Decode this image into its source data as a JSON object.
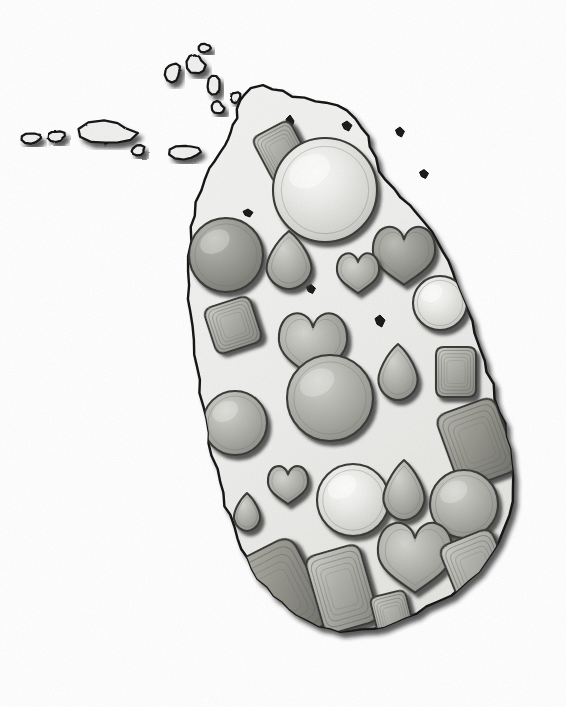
{
  "illustration": {
    "title": "Sri Lanka Gemstone Map",
    "subject": "Map of Sri Lanka filled with cut gemstones",
    "style": "hand-drawn pencil-shaded grayscale illustration",
    "background_color": "#ffffff",
    "landmass_fill": "#eeeeec",
    "landmass_outline_color": "#111111",
    "drop_shadow_color": "#2a2a2a",
    "gem_outline_color": "#3a3a3a",
    "caption": ""
  },
  "palette": {
    "gem_light_highlight": "#f2f2f0",
    "gem_light_mid": "#d9d9d6",
    "gem_mid_highlight": "#c6c6c2",
    "gem_mid_base": "#a2a29e",
    "gem_dark_base": "#8d8d89",
    "gem_edge": "#6d6d69",
    "island_fill": "#eeeeec",
    "island_stroke": "#111111",
    "sea": "#ffffff"
  },
  "landmass": {
    "name": "Sri Lanka",
    "outline_path": "M243,95 L238,108 L234,118 L230,124 L226,129 L222,133 L219,138 L216,144 L214,150 L211,157 L208,164 L205,172 L202,181 L199,190 L196,199 L194,208 L192,217 L190,226 L189,235 L188,244 L186,252 L185,261 L184,270 L183,279 L183,288 L183,297 L184,306 L185,315 L187,324 L189,333 L191,342 L193,351 L195,360 L197,369 L199,378 L202,387 L205,396 L208,405 L211,414 L214,423 L217,432 L220,441 L224,450 L228,459 L232,468 L236,477 L240,486 L244,495 L248,504 L252,513 L257,522 L262,531 L267,540 L272,549 L278,558 L284,566 L290,574 L297,581 L304,588 L311,594 L318,600 L325,605 L332,610 L339,614 L346,618 L353,621 L360,624 L367,626 L374,627 L381,628 L388,628 L395,627 L402,625 L409,622 L416,619 L423,615 L430,610 L437,604 L443,597 L449,590 L455,582 L460,573 L465,564 L469,554 L473,544 L477,533 L480,522 L483,510 L486,498 L489,486 L491,473 L493,460 L495,447 L497,434 L499,420 L501,406 L503,392 L505,378 L507,364 L509,350 L510,336 L511,322 L511,308 L510,294 L508,280 L506,266 L503,253 L500,240 L496,227 L492,215 L487,203 L482,192 L477,181 L471,171 L465,161 L459,152 L452,144 L445,137 L438,130 L430,124 L422,119 L414,114 L406,110 L398,107 L390,104 L382,102 L374,100 L366,98 L358,97 L350,95 L342,94 L334,93 L326,92 L318,91 L310,91 L302,91 L294,92 L286,93 L278,94 L270,94 L262,94 L254,94 Z",
    "peninsula_label": "Jaffna Peninsula"
  },
  "islands": [
    {
      "name": "adams-bridge-islet-1",
      "cx": 32,
      "cy": 138,
      "rx": 10,
      "ry": 6
    },
    {
      "name": "adams-bridge-islet-2",
      "cx": 57,
      "cy": 136,
      "rx": 9,
      "ry": 6
    },
    {
      "name": "mannar-island",
      "cx": 108,
      "cy": 133,
      "rx": 28,
      "ry": 13
    },
    {
      "name": "adams-bridge-islet-3",
      "cx": 138,
      "cy": 150,
      "rx": 7,
      "ry": 5
    },
    {
      "name": "talaimannar-islet",
      "cx": 186,
      "cy": 152,
      "rx": 16,
      "ry": 8
    },
    {
      "name": "delft-islet-1",
      "cx": 173,
      "cy": 72,
      "rx": 8,
      "ry": 10
    },
    {
      "name": "delft-islet-2",
      "cx": 196,
      "cy": 65,
      "rx": 9,
      "ry": 11
    },
    {
      "name": "karaitivu-islet",
      "cx": 213,
      "cy": 85,
      "rx": 7,
      "ry": 9
    },
    {
      "name": "punkudutivu-islet",
      "cx": 218,
      "cy": 108,
      "rx": 6,
      "ry": 7
    },
    {
      "name": "kayts-islet",
      "cx": 236,
      "cy": 97,
      "rx": 5,
      "ry": 6
    },
    {
      "name": "small-islet-north",
      "cx": 205,
      "cy": 48,
      "rx": 6,
      "ry": 5
    }
  ],
  "gems": [
    {
      "id": "gem-01",
      "shape": "cushion",
      "cx": 282,
      "cy": 152,
      "w": 42,
      "h": 52,
      "rotate": -28,
      "tone": "mid",
      "label": "cushion-cut gem"
    },
    {
      "id": "gem-02",
      "shape": "round",
      "cx": 325,
      "cy": 190,
      "r": 52,
      "tone": "light",
      "label": "round brilliant gem"
    },
    {
      "id": "gem-03",
      "shape": "round",
      "cx": 226,
      "cy": 255,
      "r": 37,
      "tone": "dark",
      "label": "round gem"
    },
    {
      "id": "gem-04",
      "shape": "pear",
      "cx": 289,
      "cy": 260,
      "w": 48,
      "h": 58,
      "rotate": 0,
      "tone": "mid",
      "label": "pear-cut gem"
    },
    {
      "id": "gem-05",
      "shape": "heart",
      "cx": 404,
      "cy": 251,
      "w": 62,
      "h": 58,
      "rotate": 0,
      "tone": "dark",
      "label": "heart-cut gem"
    },
    {
      "id": "gem-06",
      "shape": "heart",
      "cx": 358,
      "cy": 270,
      "w": 42,
      "h": 40,
      "rotate": 0,
      "tone": "mid",
      "label": "heart-cut gem"
    },
    {
      "id": "gem-07",
      "shape": "round",
      "cx": 440,
      "cy": 303,
      "r": 27,
      "tone": "light",
      "label": "round gem"
    },
    {
      "id": "gem-08",
      "shape": "cushion",
      "cx": 233,
      "cy": 325,
      "w": 48,
      "h": 48,
      "rotate": -18,
      "tone": "mid",
      "label": "cushion-cut gem"
    },
    {
      "id": "gem-09",
      "shape": "heart",
      "cx": 313,
      "cy": 340,
      "w": 68,
      "h": 64,
      "rotate": 0,
      "tone": "mid",
      "label": "heart-cut gem"
    },
    {
      "id": "gem-10",
      "shape": "round",
      "cx": 330,
      "cy": 398,
      "r": 43,
      "tone": "mid",
      "label": "round gem"
    },
    {
      "id": "gem-11",
      "shape": "round",
      "cx": 235,
      "cy": 423,
      "r": 32,
      "tone": "mid",
      "label": "round gem"
    },
    {
      "id": "gem-12",
      "shape": "pear",
      "cx": 398,
      "cy": 372,
      "w": 42,
      "h": 56,
      "rotate": 0,
      "tone": "mid",
      "label": "pear-cut gem"
    },
    {
      "id": "gem-13",
      "shape": "cushion",
      "cx": 456,
      "cy": 372,
      "w": 40,
      "h": 50,
      "rotate": 0,
      "tone": "mid",
      "label": "cushion-cut gem"
    },
    {
      "id": "gem-14",
      "shape": "cushion",
      "cx": 477,
      "cy": 443,
      "w": 62,
      "h": 78,
      "rotate": -20,
      "tone": "dark",
      "label": "emerald-cut gem"
    },
    {
      "id": "gem-15",
      "shape": "heart",
      "cx": 288,
      "cy": 482,
      "w": 40,
      "h": 38,
      "rotate": 0,
      "tone": "mid",
      "label": "heart-cut gem"
    },
    {
      "id": "gem-16",
      "shape": "pear",
      "cx": 247,
      "cy": 512,
      "w": 28,
      "h": 38,
      "rotate": 0,
      "tone": "mid",
      "label": "pear-cut gem"
    },
    {
      "id": "gem-17",
      "shape": "round",
      "cx": 353,
      "cy": 500,
      "r": 36,
      "tone": "light",
      "label": "round gem"
    },
    {
      "id": "gem-18",
      "shape": "pear",
      "cx": 404,
      "cy": 490,
      "w": 44,
      "h": 60,
      "rotate": 0,
      "tone": "mid",
      "label": "pear-cut gem"
    },
    {
      "id": "gem-19",
      "shape": "round",
      "cx": 464,
      "cy": 504,
      "r": 34,
      "tone": "mid",
      "label": "round gem"
    },
    {
      "id": "gem-20",
      "shape": "heart",
      "cx": 415,
      "cy": 552,
      "w": 74,
      "h": 70,
      "rotate": 0,
      "tone": "mid",
      "label": "heart-cut gem"
    },
    {
      "id": "gem-21",
      "shape": "cushion",
      "cx": 477,
      "cy": 570,
      "w": 56,
      "h": 70,
      "rotate": -22,
      "tone": "mid",
      "label": "cushion-cut gem"
    },
    {
      "id": "gem-22",
      "shape": "cushion",
      "cx": 277,
      "cy": 595,
      "w": 78,
      "h": 96,
      "rotate": -27,
      "tone": "dark",
      "label": "step-cut gem"
    },
    {
      "id": "gem-23",
      "shape": "cushion",
      "cx": 342,
      "cy": 589,
      "w": 56,
      "h": 80,
      "rotate": -16,
      "tone": "mid",
      "label": "step-cut gem"
    },
    {
      "id": "gem-24",
      "shape": "cushion",
      "cx": 393,
      "cy": 618,
      "w": 36,
      "h": 50,
      "rotate": -14,
      "tone": "mid",
      "label": "step-cut gem"
    }
  ],
  "inland_marks": [
    {
      "name": "inland-mark-1",
      "cx": 248,
      "cy": 213,
      "w": 10,
      "h": 8
    },
    {
      "name": "inland-mark-2",
      "cx": 311,
      "cy": 289,
      "w": 9,
      "h": 9
    },
    {
      "name": "inland-mark-3",
      "cx": 380,
      "cy": 321,
      "w": 10,
      "h": 12
    },
    {
      "name": "inland-mark-4",
      "cx": 290,
      "cy": 122,
      "w": 8,
      "h": 14
    },
    {
      "name": "inland-mark-5",
      "cx": 347,
      "cy": 126,
      "w": 10,
      "h": 10
    },
    {
      "name": "inland-mark-6",
      "cx": 400,
      "cy": 132,
      "w": 9,
      "h": 10
    },
    {
      "name": "inland-mark-7",
      "cx": 424,
      "cy": 174,
      "w": 9,
      "h": 9
    },
    {
      "name": "inland-mark-8",
      "cx": 426,
      "cy": 237,
      "w": 9,
      "h": 10
    }
  ]
}
